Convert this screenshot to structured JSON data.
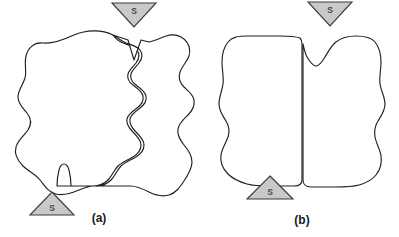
{
  "figure": {
    "background_color": "#ffffff",
    "stroke_color": "#231f20",
    "marker_fill_color": "#c9c9c9",
    "marker_stroke_color": "#3b3b3b",
    "caption_color": "#1a1a1a",
    "panels": [
      {
        "id": "panel-a",
        "caption": "(a)",
        "caption_x": 99,
        "caption_y": 218,
        "description": "Two irregular interlocking lobate shapes with wavy boundary",
        "markers": [
          {
            "id": "marker-a-top",
            "label": "S",
            "orientation": "down",
            "cx": 134,
            "cy": 14,
            "half_width": 22,
            "height": 24,
            "label_x": 134,
            "label_y": 10
          },
          {
            "id": "marker-a-bottom",
            "label": "S",
            "orientation": "up",
            "cx": 52,
            "cy": 210,
            "half_width": 21,
            "height": 23,
            "label_x": 52,
            "label_y": 212
          }
        ],
        "shapes": [
          {
            "id": "shape-a-left",
            "path": "M 108 35 C 96 30 82 31 71 36 C 60 41 50 44 41 43 C 33 42 27 47 25 55 C 23 63 26 70 24 77 C 22 84 17 89 17 96 C 17 103 22 107 26 112 C 30 117 31 123 27 129 C 23 135 17 139 15 146 C 13 153 16 160 21 165 C 26 170 33 173 38 179 C 43 185 47 192 55 195 C 63 198 72 196 79 193 C 86 190 93 188 99 190 L 52 190 L 52 190 Z"
          },
          {
            "id": "shape-a-left-real",
            "path": "M 113 35 C 101 29 86 30 74 35 C 63 40 52 44 43 43 C 34 42 28 48 26 56 C 24 64 27 71 25 78 C 23 85 18 90 18 97 C 18 104 23 108 27 113 C 31 118 32 124 28 130 C 24 136 18 140 16 147 C 14 154 18 161 23 166 C 28 171 35 174 40 180 C 45 186 48 192 56 194 C 64 196 72 193 79 190 C 84 188 89 186 93 186 L 57 186 C 57 180 58 174 59 170 C 60 166 62 164 64 164 C 66 164 68 166 69 170 C 70 174 71 180 71 186 L 93 186 C 99 186 104 184 108 180 C 112 176 114 170 118 166 C 122 162 128 160 133 157 C 138 154 141 150 141 145 C 141 140 137 136 133 132 C 129 128 126 124 127 119 C 128 114 133 111 137 108 C 141 105 144 101 143 96 C 142 91 137 88 133 85 C 129 82 127 78 128 74 C 129 70 133 67 136 63 C 139 59 140 54 137 50 C 134 46 128 45 123 43 C 118 41 115 38 113 35 Z"
          },
          {
            "id": "shape-a-right",
            "path": "M 113 35 C 118 38 121 41 126 43 C 131 45 137 46 140 50 C 143 54 142 59 139 63 C 136 67 132 70 131 74 C 130 78 132 82 136 85 C 140 88 145 91 146 96 C 147 101 144 105 140 108 C 136 111 131 114 130 119 C 129 124 132 128 136 132 C 140 136 144 140 144 145 C 144 150 141 154 136 157 C 131 160 125 162 121 166 C 117 170 115 176 111 180 C 107 184 102 186 96 186 L 131 186 C 137 186 143 189 149 192 C 155 195 162 197 169 195 C 176 193 180 187 184 181 C 188 175 192 169 192 162 C 192 155 188 150 184 145 C 180 140 177 135 178 129 C 179 123 184 119 188 115 C 192 111 195 106 194 100 C 193 94 188 91 184 87 C 180 83 178 78 180 72 C 182 66 187 62 189 56 C 191 50 189 43 184 39 C 179 35 172 34 166 36 C 160 38 155 41 149 42 L 131 42 L 135 58 L 139 42 L 124 31 Z"
          },
          {
            "id": "shape-a-right-real",
            "path": "M 149 42 C 155 41 160 38 166 36 C 172 34 179 35 184 39 C 189 43 191 50 189 56 C 187 62 182 66 180 72 C 178 78 180 83 184 87 C 188 91 193 94 194 100 C 195 106 192 111 188 115 C 184 119 179 123 178 129 C 177 135 180 140 184 145 C 188 150 192 155 192 162 C 192 169 188 175 184 181 C 180 187 176 193 169 195 C 162 197 155 195 149 192 C 143 189 137 186 131 186 L 96 186 C 102 186 107 184 111 180 C 115 176 117 170 121 166 C 125 162 131 160 136 157 C 141 154 144 150 144 145 C 144 140 140 136 136 132 C 132 128 129 124 130 119 C 131 114 136 111 140 108 C 144 105 147 101 146 96 C 145 91 140 88 136 85 C 132 82 130 78 131 74 C 132 70 136 67 139 63 C 142 59 143 54 140 50 C 137 46 131 45 126 43 C 121 41 118 38 113 35 L 128 40 L 134 60 L 141 40 Z"
          }
        ]
      },
      {
        "id": "panel-b",
        "caption": "(b)",
        "caption_x": 300,
        "caption_y": 220,
        "description": "Two fitted-together lobate shapes separated by a near-vertical seam",
        "markers": [
          {
            "id": "marker-b-top",
            "label": "S",
            "orientation": "down",
            "cx": 330,
            "cy": 12,
            "half_width": 22,
            "height": 24,
            "label_x": 330,
            "label_y": 8
          },
          {
            "id": "marker-b-bottom",
            "label": "S",
            "orientation": "up",
            "cx": 270,
            "cy": 200,
            "half_width": 23,
            "height": 24,
            "label_x": 270,
            "label_y": 202
          }
        ],
        "shapes": [
          {
            "id": "shape-b-left",
            "path": "M 300 38 C 294 36 287 36 280 36 C 271 36 258 36 248 36 C 238 36 232 37 228 42 C 224 47 222 54 222 62 C 222 70 224 77 223 84 C 222 91 219 97 219 104 C 219 111 223 116 226 121 C 229 126 230 131 228 137 C 226 143 222 148 221 155 C 220 162 223 169 228 174 C 233 179 240 182 247 184 C 254 186 262 186 270 186 C 278 186 287 186 294 186 C 299 186 302 184 302 180 L 302 44 C 302 41 301 39 300 38 Z"
          },
          {
            "id": "shape-b-right",
            "path": "M 303 44 L 303 180 C 303 184 306 187 311 187 C 318 187 327 187 335 187 C 343 187 352 187 359 185 C 366 183 372 180 376 175 C 380 170 382 163 381 156 C 380 149 376 143 375 137 C 374 131 375 126 378 121 C 381 116 385 111 385 104 C 385 97 381 91 380 84 C 379 77 381 70 381 62 C 381 54 379 47 375 42 C 371 37 364 36 356 36 C 348 36 341 38 336 42 C 331 46 328 52 325 57 C 322 62 319 66 316 66 C 313 66 310 62 307 57 C 305 53 304 48 303 44 Z"
          }
        ]
      }
    ]
  }
}
